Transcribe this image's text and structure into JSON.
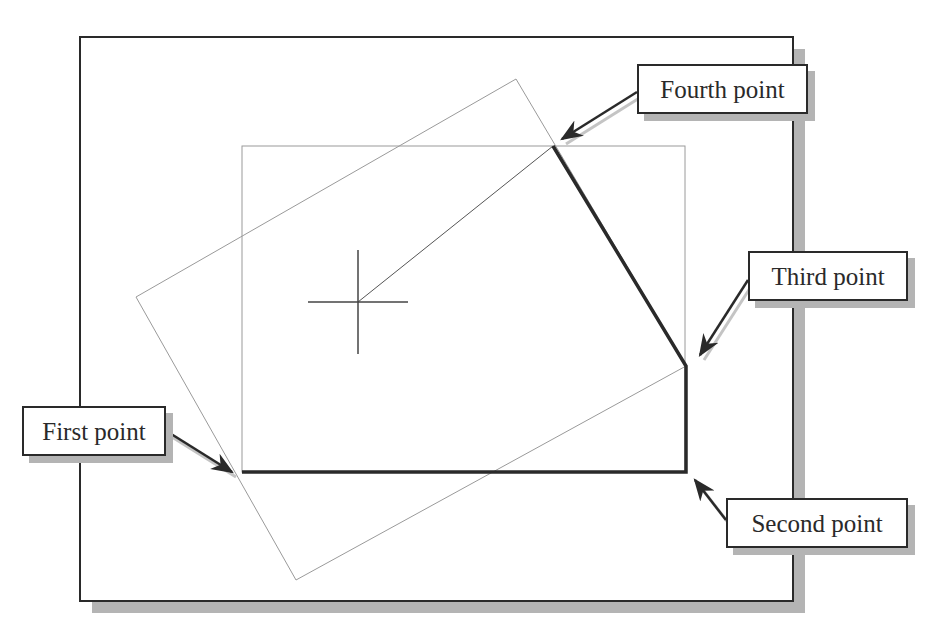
{
  "diagram": {
    "frame": {
      "x": 80,
      "y": 37,
      "w": 713,
      "h": 564,
      "shadow_color": "#b4b4b4",
      "border_color": "#2a2a2a"
    },
    "grid_rect": {
      "x": 242,
      "y": 146,
      "w": 443,
      "h": 326,
      "color": "#9a9a9a"
    },
    "rotated_rect": {
      "points": "136,297 516,79 686,366 296,580",
      "color": "#9a9a9a"
    },
    "polyline_thick": {
      "points": "242,472 686,472 686,366 553,146",
      "color": "#2a2a2a"
    },
    "rubber_band": {
      "from": [
        358,
        302
      ],
      "to": [
        553,
        146
      ],
      "color": "#555555"
    },
    "cursor": {
      "cx": 358,
      "cy": 302,
      "half_w": 50,
      "half_h": 52,
      "color": "#444444"
    },
    "callouts": [
      {
        "id": "first-point",
        "label": "First point",
        "x": 22,
        "y": 406,
        "w": 144,
        "h": 50,
        "arrow_from": [
          168,
          432
        ],
        "arrow_to": [
          232,
          472
        ]
      },
      {
        "id": "second-point",
        "label": "Second point",
        "x": 726,
        "y": 498,
        "w": 182,
        "h": 50,
        "arrow_from": [
          726,
          520
        ],
        "arrow_to": [
          695,
          480
        ]
      },
      {
        "id": "third-point",
        "label": "Third point",
        "x": 748,
        "y": 251,
        "w": 160,
        "h": 50,
        "arrow_from": [
          748,
          280
        ],
        "arrow_to": [
          700,
          355
        ]
      },
      {
        "id": "fourth-point",
        "label": "Fourth point",
        "x": 637,
        "y": 64,
        "w": 171,
        "h": 50,
        "arrow_from": [
          637,
          92
        ],
        "arrow_to": [
          562,
          139
        ]
      }
    ]
  }
}
